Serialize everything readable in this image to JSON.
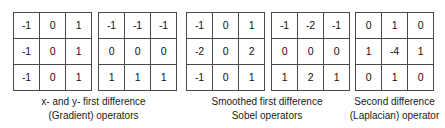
{
  "figure": {
    "background_color": "#ffffff",
    "border_color": "#4a4a4a",
    "text_color": "#1a1a1a"
  },
  "groups": [
    {
      "id": "gradient",
      "caption_line1": "x- and y- first difference",
      "caption_line2": "(Gradient) operators",
      "matrices": [
        {
          "name": "x-first-difference",
          "rows": [
            [
              "-1",
              "0",
              "1"
            ],
            [
              "-1",
              "0",
              "1"
            ],
            [
              "-1",
              "0",
              "1"
            ]
          ]
        },
        {
          "name": "y-first-difference",
          "rows": [
            [
              "-1",
              "-1",
              "-1"
            ],
            [
              "0",
              "0",
              "0"
            ],
            [
              "1",
              "1",
              "1"
            ]
          ]
        }
      ]
    },
    {
      "id": "sobel",
      "caption_line1": "Smoothed first difference",
      "caption_line2": "Sobel operators",
      "matrices": [
        {
          "name": "sobel-x",
          "rows": [
            [
              "-1",
              "0",
              "1"
            ],
            [
              "-2",
              "0",
              "2"
            ],
            [
              "-1",
              "0",
              "1"
            ]
          ]
        },
        {
          "name": "sobel-y",
          "rows": [
            [
              "-1",
              "-2",
              "-1"
            ],
            [
              "0",
              "0",
              "0"
            ],
            [
              "1",
              "2",
              "1"
            ]
          ]
        }
      ]
    },
    {
      "id": "laplacian",
      "caption_line1": "Second difference",
      "caption_line2": "(Laplacian) operator",
      "matrices": [
        {
          "name": "laplacian",
          "rows": [
            [
              "0",
              "1",
              "0"
            ],
            [
              "1",
              "-4",
              "1"
            ],
            [
              "0",
              "1",
              "0"
            ]
          ]
        }
      ]
    }
  ]
}
